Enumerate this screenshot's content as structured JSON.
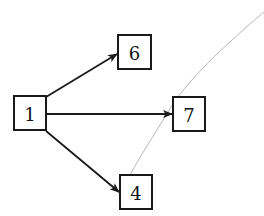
{
  "diagram": {
    "type": "directed-graph",
    "nodes": [
      {
        "id": "1",
        "label": "1",
        "x": 14,
        "y": 96,
        "w": 32,
        "h": 34
      },
      {
        "id": "6",
        "label": "6",
        "x": 118,
        "y": 35,
        "w": 33,
        "h": 34
      },
      {
        "id": "7",
        "label": "7",
        "x": 173,
        "y": 97,
        "w": 32,
        "h": 34
      },
      {
        "id": "4",
        "label": "4",
        "x": 120,
        "y": 175,
        "w": 32,
        "h": 34
      }
    ],
    "edges": [
      {
        "from": "1",
        "to": "6"
      },
      {
        "from": "1",
        "to": "7"
      },
      {
        "from": "1",
        "to": "4"
      }
    ],
    "curve": {
      "description": "thin gray arc crossing near node 7 and ending at node 4"
    }
  }
}
